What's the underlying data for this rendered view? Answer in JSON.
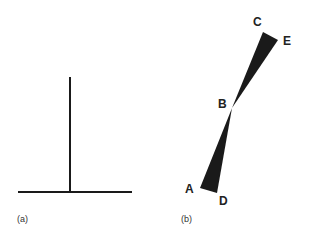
{
  "panels": [
    {
      "id": "a",
      "caption": "(a)",
      "description": "Inverted T: vertical line standing on horizontal base line"
    },
    {
      "id": "b",
      "caption": "(b)",
      "description": "Two dark wedge triangles meeting at point B",
      "points": {
        "A": "A",
        "B": "B",
        "C": "C",
        "D": "D",
        "E": "E"
      }
    }
  ],
  "colors": {
    "line": "#1a1a1a",
    "wedge": "#1a1a1a",
    "background": "#ffffff"
  }
}
